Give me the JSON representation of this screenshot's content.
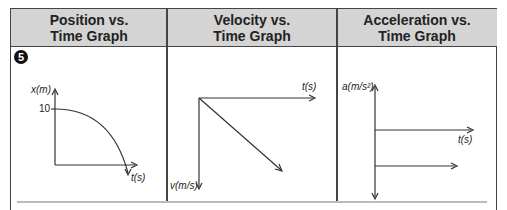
{
  "table": {
    "columns": [
      {
        "header": "Position vs.\nTime Graph",
        "header_line1": "Position vs.",
        "header_line2": "Time Graph"
      },
      {
        "header": "Velocity vs.\nTime Graph",
        "header_line1": "Velocity vs.",
        "header_line2": "Time Graph"
      },
      {
        "header": "Acceleration vs.\nTime Graph",
        "header_line1": "Acceleration vs.",
        "header_line2": "Time Graph"
      }
    ],
    "row_number": "5"
  },
  "graphs": {
    "position": {
      "y_label": "x(m)",
      "x_label": "t(s)",
      "tick_value": "10"
    },
    "velocity": {
      "y_label": "v(m/s)",
      "x_label": "t(s)"
    },
    "acceleration": {
      "y_label": "a(m/s²)",
      "x_label": "t(s)"
    }
  },
  "colors": {
    "header_bg": "#d4d4d4",
    "border": "#444444",
    "line": "#333333"
  }
}
